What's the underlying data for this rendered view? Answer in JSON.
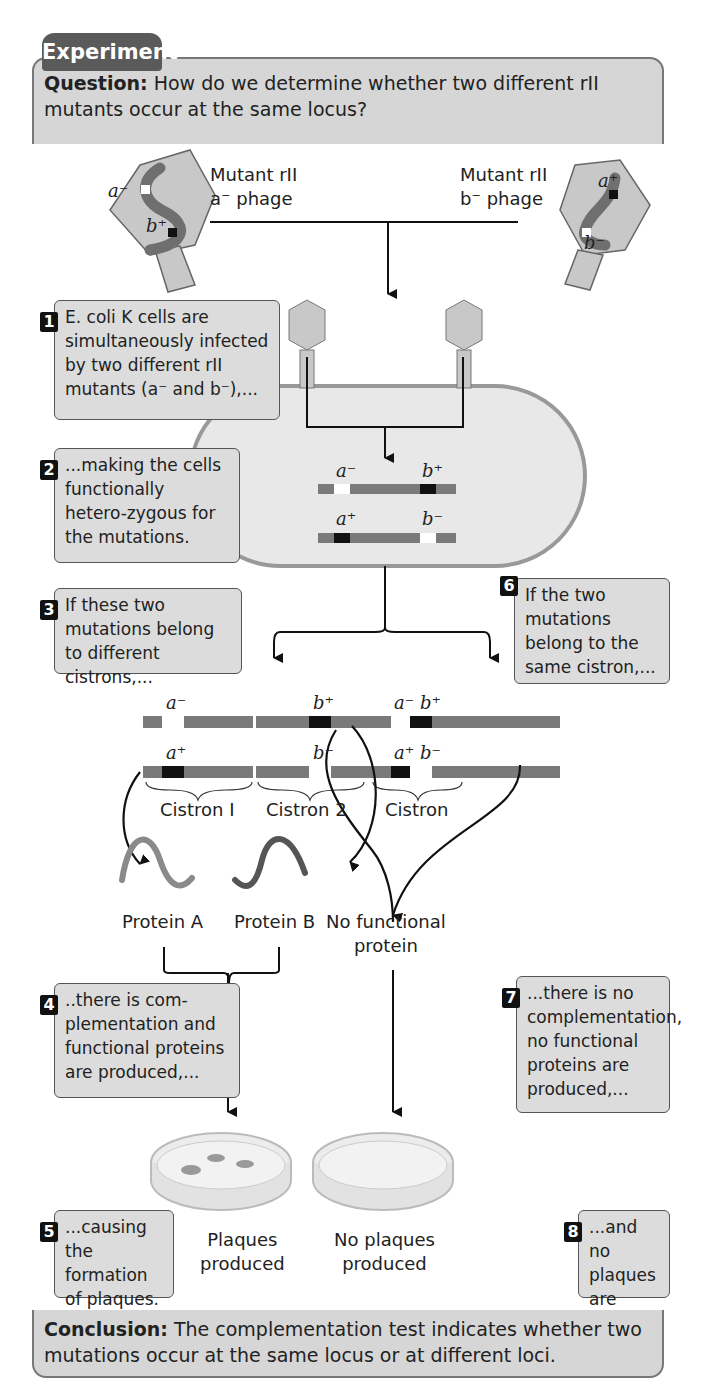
{
  "header": {
    "tab_label": "Experiment",
    "question_label": "Question:",
    "question_text": "How do we determine whether two different rII mutants occur at the same locus?"
  },
  "phages": {
    "left": {
      "title_line1": "Mutant rII",
      "title_line2": "a⁻ phage",
      "gene_top": "a⁻",
      "gene_bottom": "b⁺"
    },
    "right": {
      "title_line1": "Mutant rII",
      "title_line2": "b⁻ phage",
      "gene_top": "a⁺",
      "gene_bottom": "b⁻"
    }
  },
  "steps": [
    {
      "number": "1",
      "text": "E. coli K cells are simultaneously infected by two different rII mutants (a⁻ and b⁻),..."
    },
    {
      "number": "2",
      "text": "...making the cells functionally hetero-zygous for the mutations."
    },
    {
      "number": "3",
      "text": "If these two mutations belong to different cistrons,..."
    },
    {
      "number": "4",
      "text": "..there is com-plementation and functional proteins are produced,..."
    },
    {
      "number": "5",
      "text": "...causing the formation of plaques."
    },
    {
      "number": "6",
      "text": "If the two mutations belong to the same cistron,..."
    },
    {
      "number": "7",
      "text": "...there is no complementation, no functional proteins are produced,..."
    },
    {
      "number": "8",
      "text": "...and no plaques are formed."
    }
  ],
  "cell_genes": {
    "top_left": "a⁻",
    "top_right": "b⁺",
    "bottom_left": "a⁺",
    "bottom_right": "b⁻"
  },
  "left_branch": {
    "genes": {
      "top_left": "a⁻",
      "top_right": "b⁺",
      "bottom_left": "a⁺",
      "bottom_right": "b⁻"
    },
    "cistron1": "Cistron I",
    "cistron2": "Cistron 2",
    "protein_a": "Protein A",
    "protein_b": "Protein B",
    "dish_label_line1": "Plaques",
    "dish_label_line2": "produced"
  },
  "right_branch": {
    "gene_top": "a⁻ b⁺",
    "gene_bottom": "a⁺ b⁻",
    "cistron": "Cistron",
    "protein_line1": "No functional",
    "protein_line2": "protein",
    "dish_label_line1": "No plaques",
    "dish_label_line2": "produced"
  },
  "conclusion": {
    "label": "Conclusion:",
    "text": "The complementation test indicates whether two mutations occur at the same locus or at different loci."
  },
  "colors": {
    "panel": "#d6d6d6",
    "tab": "#5a5a5a",
    "dna": "#7a7a7a",
    "protein_a": "#8a8a8a",
    "protein_b": "#555555"
  }
}
